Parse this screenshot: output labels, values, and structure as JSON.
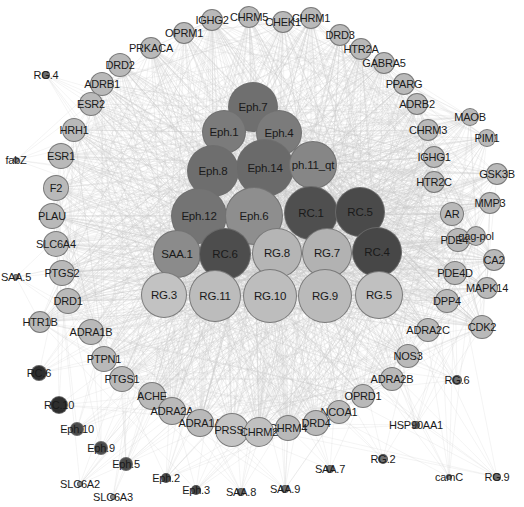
{
  "figure": {
    "type": "network-graph",
    "title": "",
    "width": 524,
    "height": 507,
    "background": "#ffffff",
    "edge_color": "#c8c8c8",
    "label_color": "#1a1a1a"
  },
  "palette": {
    "darkest": "#4a4a4a",
    "dark": "#5e5e5e",
    "medium_dark": "#757575",
    "medium": "#8c8c8c",
    "medium_light": "#a3a3a3",
    "light": "#b8b8b8",
    "lighter": "#c4c4c4",
    "lightest": "#cfcfcf",
    "peripheral": "#b9b9b9",
    "tiny_dark": "#3d3d3d"
  },
  "core_nodes": [
    {
      "id": "Eph.7",
      "label": "Eph.7",
      "x": 253,
      "y": 107,
      "r": 25,
      "color": "#6f6f6f"
    },
    {
      "id": "Eph.1",
      "label": "Eph.1",
      "x": 224,
      "y": 132,
      "r": 22,
      "color": "#7b7b7b"
    },
    {
      "id": "Eph.4",
      "label": "Eph.4",
      "x": 279,
      "y": 133,
      "r": 23,
      "color": "#7b7b7b"
    },
    {
      "id": "Eph.8",
      "label": "Eph.8",
      "x": 213,
      "y": 171,
      "r": 26,
      "color": "#6e6e6e"
    },
    {
      "id": "Eph.14",
      "label": "Eph.14",
      "x": 265,
      "y": 168,
      "r": 29,
      "color": "#6a6a6a"
    },
    {
      "id": "Eph.11_qt",
      "label": "ph.11_qt",
      "x": 313,
      "y": 165,
      "r": 24,
      "color": "#868686"
    },
    {
      "id": "Eph.12",
      "label": "Eph.12",
      "x": 199,
      "y": 216,
      "r": 28,
      "color": "#747474"
    },
    {
      "id": "Eph.6",
      "label": "Eph.6",
      "x": 254,
      "y": 216,
      "r": 29,
      "color": "#8e8e8e"
    },
    {
      "id": "RC.1",
      "label": "RC.1",
      "x": 311,
      "y": 213,
      "r": 27,
      "color": "#4f4f4f"
    },
    {
      "id": "RC.5",
      "label": "RC.5",
      "x": 360,
      "y": 212,
      "r": 25,
      "color": "#4a4a4a"
    },
    {
      "id": "SAA.1",
      "label": "SAA.1",
      "x": 177,
      "y": 254,
      "r": 24,
      "color": "#8b8b8b"
    },
    {
      "id": "RC.6",
      "label": "RC.6",
      "x": 225,
      "y": 254,
      "r": 26,
      "color": "#4d4d4d"
    },
    {
      "id": "RG.8",
      "label": "RG.8",
      "x": 277,
      "y": 253,
      "r": 25,
      "color": "#b5b5b5"
    },
    {
      "id": "RG.7",
      "label": "RG.7",
      "x": 327,
      "y": 253,
      "r": 25,
      "color": "#b2b2b2"
    },
    {
      "id": "RC.4",
      "label": "RC.4",
      "x": 377,
      "y": 252,
      "r": 25,
      "color": "#474747"
    },
    {
      "id": "RG.3",
      "label": "RG.3",
      "x": 164,
      "y": 295,
      "r": 23,
      "color": "#c2c2c2"
    },
    {
      "id": "RG.11",
      "label": "RG.11",
      "x": 215,
      "y": 296,
      "r": 26,
      "color": "#bcbcbc"
    },
    {
      "id": "RG.10",
      "label": "RG.10",
      "x": 270,
      "y": 296,
      "r": 27,
      "color": "#bdbdbd"
    },
    {
      "id": "RG.9",
      "label": "RG.9",
      "x": 325,
      "y": 296,
      "r": 27,
      "color": "#bababa"
    },
    {
      "id": "RG.5",
      "label": "RG.5",
      "x": 379,
      "y": 295,
      "r": 24,
      "color": "#c0c0c0"
    }
  ],
  "peripheral_nodes": [
    {
      "id": "IGHG2",
      "label": "IGHG2",
      "x": 212,
      "y": 20,
      "r": 11,
      "color": "#b9b9b9"
    },
    {
      "id": "CHRM5",
      "label": "CHRM5",
      "x": 249,
      "y": 17,
      "r": 11,
      "color": "#b9b9b9"
    },
    {
      "id": "CHEK1",
      "label": "CHEK1",
      "x": 283,
      "y": 22,
      "r": 11,
      "color": "#b9b9b9"
    },
    {
      "id": "CHRM1",
      "label": "CHRM1",
      "x": 311,
      "y": 18,
      "r": 11,
      "color": "#b9b9b9"
    },
    {
      "id": "OPRM1",
      "label": "OPRM1",
      "x": 184,
      "y": 33,
      "r": 11,
      "color": "#b9b9b9"
    },
    {
      "id": "DRD3",
      "label": "DRD3",
      "x": 340,
      "y": 35,
      "r": 11,
      "color": "#b9b9b9"
    },
    {
      "id": "PRKACA",
      "label": "PRKACA",
      "x": 151,
      "y": 48,
      "r": 11,
      "color": "#b9b9b9"
    },
    {
      "id": "HTR2A",
      "label": "HTR2A",
      "x": 361,
      "y": 49,
      "r": 11,
      "color": "#b9b9b9"
    },
    {
      "id": "DRD2",
      "label": "DRD2",
      "x": 120,
      "y": 65,
      "r": 12,
      "color": "#b9b9b9"
    },
    {
      "id": "GABRA5",
      "label": "GABRA5",
      "x": 384,
      "y": 63,
      "r": 11,
      "color": "#b9b9b9"
    },
    {
      "id": "ADRB1",
      "label": "ADRB1",
      "x": 102,
      "y": 84,
      "r": 12,
      "color": "#b9b9b9"
    },
    {
      "id": "PPARG",
      "label": "PPARG",
      "x": 404,
      "y": 84,
      "r": 11,
      "color": "#b9b9b9"
    },
    {
      "id": "ESR2",
      "label": "ESR2",
      "x": 91,
      "y": 104,
      "r": 12,
      "color": "#b9b9b9"
    },
    {
      "id": "ADRB2",
      "label": "ADRB2",
      "x": 417,
      "y": 104,
      "r": 11,
      "color": "#b9b9b9"
    },
    {
      "id": "HRH1",
      "label": "HRH1",
      "x": 74,
      "y": 130,
      "r": 12,
      "color": "#b9b9b9"
    },
    {
      "id": "CHRM3",
      "label": "CHRM3",
      "x": 428,
      "y": 130,
      "r": 11,
      "color": "#b9b9b9"
    },
    {
      "id": "ESR1",
      "label": "ESR1",
      "x": 61,
      "y": 156,
      "r": 13,
      "color": "#b9b9b9"
    },
    {
      "id": "IGHG1",
      "label": "IGHG1",
      "x": 434,
      "y": 157,
      "r": 11,
      "color": "#b9b9b9"
    },
    {
      "id": "F2",
      "label": "F2",
      "x": 56,
      "y": 188,
      "r": 13,
      "color": "#b9b9b9"
    },
    {
      "id": "HTR2C",
      "label": "HTR2C",
      "x": 434,
      "y": 182,
      "r": 11,
      "color": "#b9b9b9"
    },
    {
      "id": "PLAU",
      "label": "PLAU",
      "x": 52,
      "y": 216,
      "r": 13,
      "color": "#b9b9b9"
    },
    {
      "id": "AR",
      "label": "AR",
      "x": 452,
      "y": 214,
      "r": 12,
      "color": "#b9b9b9"
    },
    {
      "id": "SLC6A4",
      "label": "SLC6A4",
      "x": 56,
      "y": 244,
      "r": 13,
      "color": "#b9b9b9"
    },
    {
      "id": "PDE4B",
      "label": "PDE4B",
      "x": 458,
      "y": 240,
      "r": 12,
      "color": "#b9b9b9"
    },
    {
      "id": "PTGS2",
      "label": "PTGS2",
      "x": 62,
      "y": 273,
      "r": 13,
      "color": "#b9b9b9"
    },
    {
      "id": "PDE4D",
      "label": "PDE4D",
      "x": 455,
      "y": 273,
      "r": 12,
      "color": "#b9b9b9"
    },
    {
      "id": "DRD1",
      "label": "DRD1",
      "x": 68,
      "y": 301,
      "r": 13,
      "color": "#b9b9b9"
    },
    {
      "id": "DPP4",
      "label": "DPP4",
      "x": 447,
      "y": 301,
      "r": 12,
      "color": "#b9b9b9"
    },
    {
      "id": "HTR1B",
      "label": "HTR1B",
      "x": 40,
      "y": 322,
      "r": 11,
      "color": "#b9b9b9"
    },
    {
      "id": "ADRA1B",
      "label": "ADRA1B",
      "x": 91,
      "y": 332,
      "r": 13,
      "color": "#b9b9b9"
    },
    {
      "id": "ADRA2C",
      "label": "ADRA2C",
      "x": 428,
      "y": 330,
      "r": 12,
      "color": "#b9b9b9"
    },
    {
      "id": "CDK2",
      "label": "CDK2",
      "x": 482,
      "y": 327,
      "r": 12,
      "color": "#b9b9b9"
    },
    {
      "id": "PTPN1",
      "label": "PTPN1",
      "x": 104,
      "y": 359,
      "r": 13,
      "color": "#b9b9b9"
    },
    {
      "id": "NOS3",
      "label": "NOS3",
      "x": 408,
      "y": 356,
      "r": 12,
      "color": "#b9b9b9"
    },
    {
      "id": "PTGS1",
      "label": "PTGS1",
      "x": 122,
      "y": 379,
      "r": 13,
      "color": "#b9b9b9"
    },
    {
      "id": "ADRA2B",
      "label": "ADRA2B",
      "x": 392,
      "y": 379,
      "r": 12,
      "color": "#b9b9b9"
    },
    {
      "id": "ACHE",
      "label": "ACHE",
      "x": 152,
      "y": 396,
      "r": 14,
      "color": "#b9b9b9"
    },
    {
      "id": "OPRD1",
      "label": "OPRD1",
      "x": 363,
      "y": 396,
      "r": 12,
      "color": "#b9b9b9"
    },
    {
      "id": "ADRA2A",
      "label": "ADRA2A",
      "x": 172,
      "y": 411,
      "r": 14,
      "color": "#b9b9b9"
    },
    {
      "id": "NCOA1",
      "label": "NCOA1",
      "x": 339,
      "y": 412,
      "r": 12,
      "color": "#b9b9b9"
    },
    {
      "id": "ADRA1A",
      "label": "ADRA1A",
      "x": 200,
      "y": 423,
      "r": 14,
      "color": "#b9b9b9"
    },
    {
      "id": "DRD4",
      "label": "DRD4",
      "x": 316,
      "y": 423,
      "r": 13,
      "color": "#b9b9b9"
    },
    {
      "id": "PRSS1",
      "label": "PRSS1",
      "x": 232,
      "y": 430,
      "r": 17,
      "color": "#c4c4c4"
    },
    {
      "id": "CHRM4",
      "label": "CHRM4",
      "x": 288,
      "y": 428,
      "r": 13,
      "color": "#b9b9b9"
    },
    {
      "id": "CHRM2",
      "label": "CHRM2",
      "x": 259,
      "y": 432,
      "r": 15,
      "color": "#c0c0c0"
    },
    {
      "id": "MMP3",
      "label": "MMP3",
      "x": 490,
      "y": 203,
      "r": 11,
      "color": "#b9b9b9"
    },
    {
      "id": "GSK3B",
      "label": "GSK3B",
      "x": 497,
      "y": 174,
      "r": 11,
      "color": "#b9b9b9"
    },
    {
      "id": "CA2",
      "label": "CA2",
      "x": 494,
      "y": 260,
      "r": 11,
      "color": "#b9b9b9"
    },
    {
      "id": "MAPK14",
      "label": "MAPK14",
      "x": 487,
      "y": 288,
      "r": 11,
      "color": "#b9b9b9"
    },
    {
      "id": "gag-pol",
      "label": "gag-pol",
      "x": 476,
      "y": 236,
      "r": 10,
      "color": "#b9b9b9"
    },
    {
      "id": "MAOB",
      "label": "MAOB",
      "x": 470,
      "y": 117,
      "r": 9,
      "color": "#b9b9b9"
    },
    {
      "id": "PIM1",
      "label": "PIM1",
      "x": 487,
      "y": 138,
      "r": 9,
      "color": "#b9b9b9"
    }
  ],
  "small_nodes": [
    {
      "id": "RG.4",
      "label": "RG.4",
      "x": 46,
      "y": 75,
      "r": 4,
      "color": "#6f6f6f"
    },
    {
      "id": "fabZ",
      "label": "fabZ",
      "x": 16,
      "y": 160,
      "r": 3,
      "color": "#8a8a8a"
    },
    {
      "id": "SAA.5",
      "label": "SAA.5",
      "x": 16,
      "y": 277,
      "r": 3,
      "color": "#8a8a8a"
    },
    {
      "id": "RC.6b",
      "label": "RC.6",
      "x": 39,
      "y": 373,
      "r": 8,
      "color": "#2e2e2e"
    },
    {
      "id": "RC.10",
      "label": "RC.10",
      "x": 59,
      "y": 405,
      "r": 9,
      "color": "#2e2e2e"
    },
    {
      "id": "Eph.10",
      "label": "Eph.10",
      "x": 77,
      "y": 429,
      "r": 7,
      "color": "#4a4a4a"
    },
    {
      "id": "Eph.9",
      "label": "Eph.9",
      "x": 101,
      "y": 448,
      "r": 7,
      "color": "#4a4a4a"
    },
    {
      "id": "Eph.5",
      "label": "Eph.5",
      "x": 126,
      "y": 464,
      "r": 7,
      "color": "#4a4a4a"
    },
    {
      "id": "SLC6A2",
      "label": "SLC6A2",
      "x": 80,
      "y": 484,
      "r": 3,
      "color": "#8a8a8a"
    },
    {
      "id": "SLC6A3",
      "label": "SLC6A3",
      "x": 113,
      "y": 497,
      "r": 3,
      "color": "#8a8a8a"
    },
    {
      "id": "Eph.2",
      "label": "Eph.2",
      "x": 166,
      "y": 478,
      "r": 5,
      "color": "#4a4a4a"
    },
    {
      "id": "Eph.3",
      "label": "Eph.3",
      "x": 196,
      "y": 490,
      "r": 5,
      "color": "#4a4a4a"
    },
    {
      "id": "SAA.8",
      "label": "SAA.8",
      "x": 241,
      "y": 492,
      "r": 4,
      "color": "#6f6f6f"
    },
    {
      "id": "SAA.9",
      "label": "SAA.9",
      "x": 285,
      "y": 489,
      "r": 4,
      "color": "#6f6f6f"
    },
    {
      "id": "SAA.7",
      "label": "SAA.7",
      "x": 330,
      "y": 469,
      "r": 4,
      "color": "#6f6f6f"
    },
    {
      "id": "HSP90AA1",
      "label": "HSP90AA1",
      "x": 416,
      "y": 425,
      "r": 4,
      "color": "#6f6f6f"
    },
    {
      "id": "RG.6",
      "label": "RG.6",
      "x": 457,
      "y": 380,
      "r": 5,
      "color": "#6f6f6f"
    },
    {
      "id": "RG.2",
      "label": "RG.2",
      "x": 383,
      "y": 459,
      "r": 5,
      "color": "#6f6f6f"
    },
    {
      "id": "camC",
      "label": "camC",
      "x": 449,
      "y": 477,
      "r": 3,
      "color": "#8a8a8a"
    },
    {
      "id": "RG.9b",
      "label": "RG.9",
      "x": 497,
      "y": 477,
      "r": 4,
      "color": "#6f6f6f"
    }
  ]
}
